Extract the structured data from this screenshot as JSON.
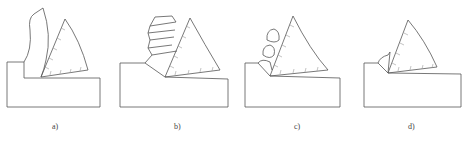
{
  "figure": {
    "panels": [
      {
        "id": "a",
        "label": "a)",
        "chip_type": "continuous-chip",
        "label_x": 53
      },
      {
        "id": "b",
        "label": "b)",
        "chip_type": "segmented-chip",
        "label_x": 175
      },
      {
        "id": "c",
        "label": "c)",
        "chip_type": "fractured-chip",
        "label_x": 295
      },
      {
        "id": "d",
        "label": "d)",
        "chip_type": "discontinuous-chip",
        "label_x": 408
      }
    ],
    "colors": {
      "stroke": "#555555",
      "hatch": "#9a9a9a"
    }
  }
}
